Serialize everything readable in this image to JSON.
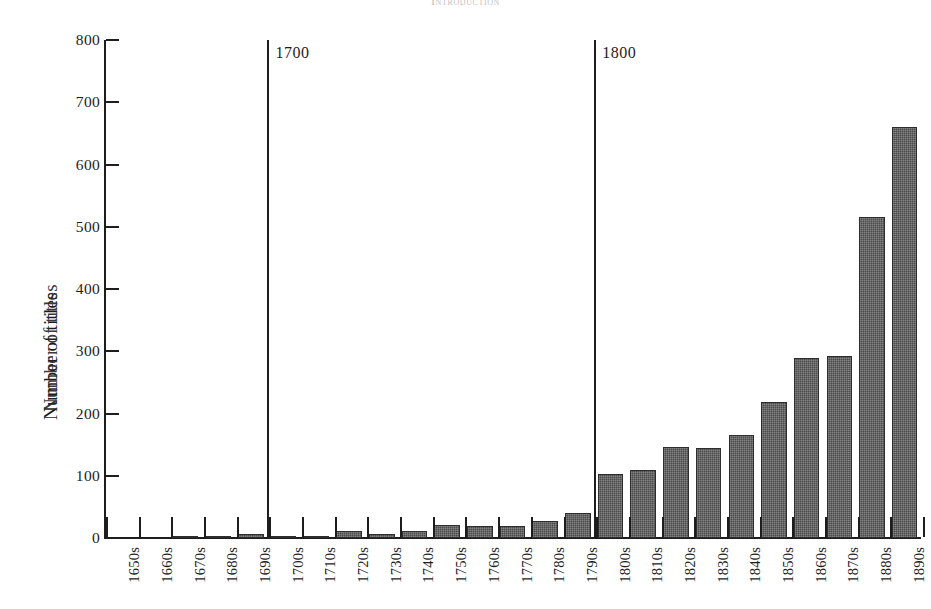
{
  "page": {
    "running_head": "Introduction"
  },
  "chart_data": {
    "type": "bar",
    "title": "",
    "xlabel": "",
    "ylabel": "Number of titles",
    "ylabel_duplicate": "Number of titles",
    "ylim": [
      0,
      800
    ],
    "yticks": [
      0,
      100,
      200,
      300,
      400,
      500,
      600,
      700,
      800
    ],
    "ytick_labels": [
      "0",
      "100",
      "200",
      "300",
      "400",
      "500",
      "600",
      "700",
      "800"
    ],
    "grid": false,
    "legend": null,
    "bar_color": "#4b4b4b",
    "axis_color": "#1d1d1d",
    "categories": [
      "1650s",
      "1660s",
      "1670s",
      "1680s",
      "1690s",
      "1700s",
      "1710s",
      "1720s",
      "1730s",
      "1740s",
      "1750s",
      "1760s",
      "1770s",
      "1780s",
      "1790s",
      "1800s",
      "1810s",
      "1820s",
      "1830s",
      "1840s",
      "1850s",
      "1860s",
      "1870s",
      "1880s",
      "1890s"
    ],
    "values": [
      0,
      0,
      3,
      2,
      6,
      3,
      1,
      12,
      7,
      11,
      21,
      19,
      19,
      28,
      40,
      103,
      110,
      146,
      145,
      165,
      219,
      289,
      292,
      515,
      660
    ],
    "annotations": [
      {
        "label": "1700",
        "at_category": "1700s",
        "type": "vertical-rule"
      },
      {
        "label": "1800",
        "at_category": "1800s",
        "type": "vertical-rule"
      }
    ]
  }
}
